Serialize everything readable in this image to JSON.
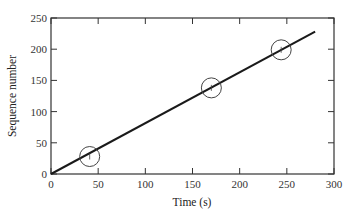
{
  "chart_data": {
    "type": "line",
    "title": "",
    "xlabel": "Time (s)",
    "ylabel": "Sequence number",
    "xlim": [
      0,
      300
    ],
    "ylim": [
      0,
      250
    ],
    "xticks": [
      0,
      50,
      100,
      150,
      200,
      250,
      300
    ],
    "yticks": [
      0,
      50,
      100,
      150,
      200,
      250
    ],
    "grid": false,
    "legend": null,
    "series": [
      {
        "name": "fit line",
        "type": "line",
        "x": [
          0,
          280
        ],
        "y": [
          0,
          228
        ]
      },
      {
        "name": "highlighted points",
        "type": "scatter",
        "marker": "open-circle",
        "x": [
          41,
          170,
          244
        ],
        "y": [
          28,
          138,
          199
        ]
      }
    ]
  },
  "colors": {
    "line": "#1a1a1a",
    "axes": "#333333",
    "circle": "#444444"
  }
}
